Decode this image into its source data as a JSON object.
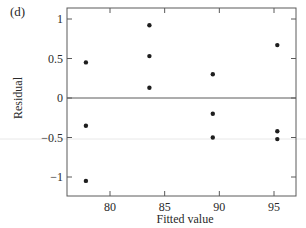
{
  "chart_data": {
    "type": "scatter",
    "panel_label": "(d)",
    "title": "",
    "xlabel": "Fitted value",
    "ylabel": "Residual",
    "xlim": [
      76.0,
      97.0
    ],
    "ylim": [
      -1.25,
      1.2
    ],
    "x_ticks": [
      80,
      85,
      90,
      95
    ],
    "x_tick_labels": [
      "80",
      "85",
      "90",
      "95"
    ],
    "y_ticks": [
      1,
      0.5,
      0,
      -0.5,
      -1
    ],
    "y_tick_labels": [
      "1",
      "0.5",
      "0",
      "−0.5",
      "−1"
    ],
    "reference_line": {
      "y": 0
    },
    "grid": false,
    "legend": null,
    "series": [
      {
        "name": "residuals",
        "points": [
          {
            "x": 77.8,
            "y": 0.45
          },
          {
            "x": 77.8,
            "y": -0.35
          },
          {
            "x": 77.8,
            "y": -1.05
          },
          {
            "x": 83.6,
            "y": 0.92
          },
          {
            "x": 83.6,
            "y": 0.53
          },
          {
            "x": 83.6,
            "y": 0.13
          },
          {
            "x": 89.4,
            "y": 0.3
          },
          {
            "x": 89.4,
            "y": -0.2
          },
          {
            "x": 89.4,
            "y": -0.5
          },
          {
            "x": 95.3,
            "y": 0.67
          },
          {
            "x": 95.3,
            "y": -0.42
          },
          {
            "x": 95.3,
            "y": -0.52
          }
        ]
      }
    ]
  },
  "colors": {
    "axis": "#5a5a5a",
    "point": "#1e1e1e",
    "text": "#2a2a2a",
    "artifact_line": "#e6e6e6"
  }
}
